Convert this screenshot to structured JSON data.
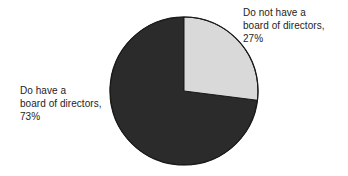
{
  "chart_data": {
    "type": "pie",
    "title": "",
    "categories": [
      "Do not have a board of directors",
      "Do have a board of directors"
    ],
    "values": [
      27,
      73
    ],
    "value_unit": "%",
    "legend_position": "none",
    "start_angle_deg": 0,
    "direction": "clockwise",
    "slices": [
      {
        "label": "Do not have a board of directors",
        "value": 27,
        "value_label": "27%",
        "color": "#d9d9d9",
        "start_deg": 0,
        "end_deg": 97.2
      },
      {
        "label": "Do have a board of directors",
        "value": 73,
        "value_label": "73%",
        "color": "#2b2b2b",
        "start_deg": 97.2,
        "end_deg": 360
      }
    ],
    "outline_color": "#1a1a1a",
    "background": "#ffffff"
  },
  "labels": {
    "right": {
      "line1": "Do not have a",
      "line2": "board of directors,",
      "line3": "27%"
    },
    "left": {
      "line1": "Do have a",
      "line2": "board of directors,",
      "line3": "73%"
    }
  }
}
